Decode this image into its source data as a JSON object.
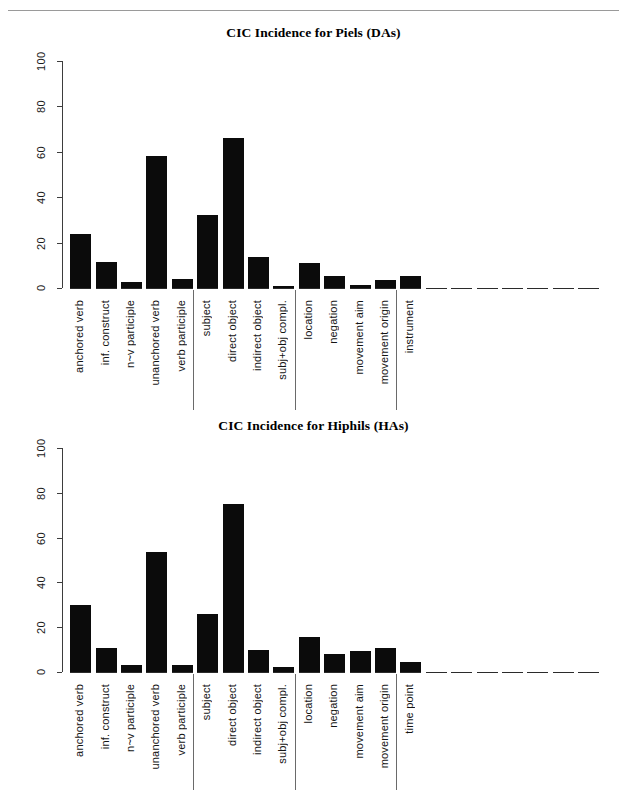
{
  "figure": {
    "top_rule": true,
    "background": "#ffffff",
    "bar_color": "#0b0b0b",
    "axis_color": "#3d3d3d"
  },
  "chart_data": [
    {
      "type": "bar",
      "title": "CIC Incidence for Piels (DAs)",
      "xlabel": "",
      "ylabel": "",
      "ylim": [
        0,
        100
      ],
      "yticks": [
        0,
        20,
        40,
        60,
        80,
        100
      ],
      "ytick_labels": [
        "0",
        "20",
        "40",
        "60",
        "80",
        "100"
      ],
      "grid": false,
      "legend": null,
      "categories": [
        "anchored verb",
        "inf. construct",
        "n~v participle",
        "unanchored verb",
        "verb participle",
        "subject",
        "direct object",
        "indirect object",
        "subj+obj compl.",
        "location",
        "negation",
        "movement aim",
        "movement origin",
        "instrument"
      ],
      "values": [
        24,
        11.5,
        2.5,
        58,
        3.8,
        32,
        66,
        13.5,
        1,
        11,
        5.5,
        1.5,
        3.5,
        5.5
      ],
      "empty_trailing_slots": 7,
      "group_separators_after": [
        4,
        8,
        12
      ]
    },
    {
      "type": "bar",
      "title": "CIC Incidence for Hiphils (HAs)",
      "xlabel": "",
      "ylabel": "",
      "ylim": [
        0,
        100
      ],
      "yticks": [
        0,
        20,
        40,
        60,
        80,
        100
      ],
      "ytick_labels": [
        "0",
        "20",
        "40",
        "60",
        "80",
        "100"
      ],
      "grid": false,
      "legend": null,
      "categories": [
        "anchored verb",
        "inf. construct",
        "n~v participle",
        "unanchored verb",
        "verb participle",
        "subject",
        "direct object",
        "indirect object",
        "subj+obj compl.",
        "location",
        "negation",
        "movement aim",
        "movement origin",
        "time point"
      ],
      "values": [
        30,
        10.5,
        3,
        53.5,
        3.2,
        26,
        75,
        10,
        2.2,
        15.5,
        8,
        9.5,
        10.5,
        4.5
      ],
      "empty_trailing_slots": 7,
      "group_separators_after": [
        4,
        8,
        12
      ]
    }
  ]
}
